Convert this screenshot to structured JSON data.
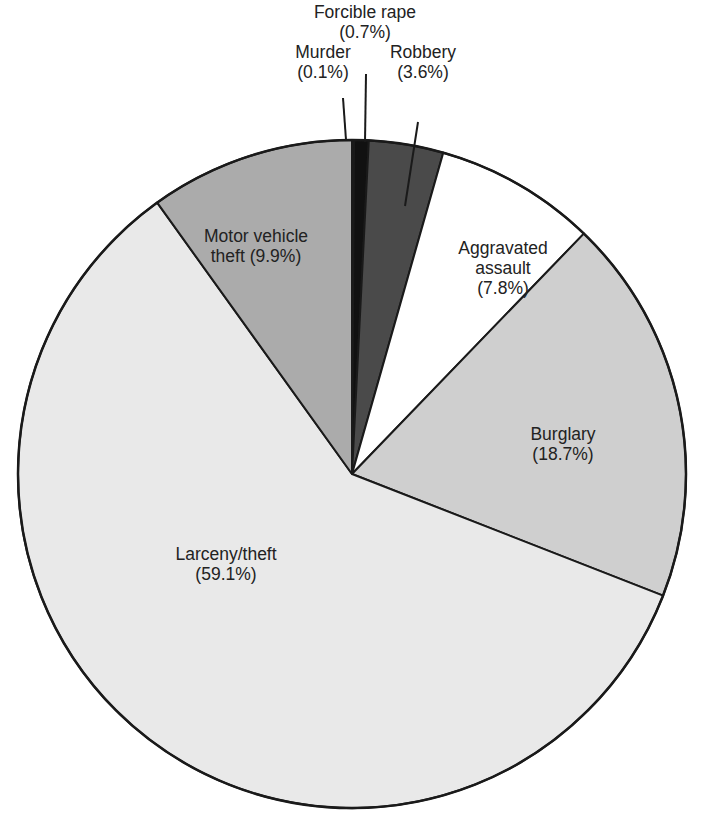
{
  "chart_data": {
    "type": "pie",
    "title": "",
    "start_angle_deg": 0,
    "direction": "clockwise",
    "slices": [
      {
        "label": "Murder",
        "value": 0.1,
        "display": "(0.1%)",
        "color": "#c8c8c8"
      },
      {
        "label": "Forcible rape",
        "value": 0.7,
        "display": "(0.7%)",
        "color": "#111111"
      },
      {
        "label": "Robbery",
        "value": 3.6,
        "display": "(3.6%)",
        "color": "#4a4a4a"
      },
      {
        "label": "Aggravated assault",
        "value": 7.8,
        "display": "(7.8%)",
        "color": "#ffffff"
      },
      {
        "label": "Burglary",
        "value": 18.7,
        "display": "(18.7%)",
        "color": "#cfcfcf"
      },
      {
        "label": "Larceny/theft",
        "value": 59.1,
        "display": "(59.1%)",
        "color": "#e9e9e9"
      },
      {
        "label": "Motor vehicle theft",
        "value": 9.9,
        "display": "(9.9%)",
        "color": "#ababab"
      }
    ],
    "units": "%"
  },
  "labels": {
    "murder": {
      "line1": "Murder",
      "line2": "(0.1%)"
    },
    "rape": {
      "line1": "Forcible rape",
      "line2": "(0.7%)"
    },
    "robbery": {
      "line1": "Robbery",
      "line2": "(3.6%)"
    },
    "assault": {
      "line1": "Aggravated",
      "line2": "assault",
      "line3": "(7.8%)"
    },
    "burglary": {
      "line1": "Burglary",
      "line2": "(18.7%)"
    },
    "larceny": {
      "line1": "Larceny/theft",
      "line2": "(59.1%)"
    },
    "motor": {
      "line1": "Motor vehicle",
      "line2": "theft (9.9%)"
    }
  }
}
